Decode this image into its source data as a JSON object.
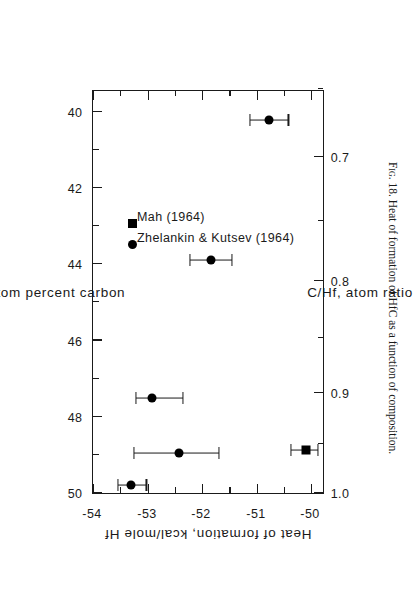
{
  "figure": {
    "caption_prefix": "Fig. 18.",
    "caption_text": "Heat of formation of HfC as a function of composition."
  },
  "chart_data": {
    "type": "scatter",
    "title": "",
    "orientation": "rotated-90-ccw",
    "xlabel": "Atom percent carbon",
    "xlabel_secondary": "C/Hf, atom ratio",
    "ylabel": "Heat of formation, kcal/mole Hf",
    "xlim": [
      39.4,
      50.0
    ],
    "ylim": [
      -54,
      -49.75
    ],
    "x_ticks": [
      50,
      48,
      46,
      44,
      42,
      40
    ],
    "x_tick_labels": [
      "50",
      "48",
      "46",
      "44",
      "42",
      "40"
    ],
    "x_minor_ticks": [
      49,
      47,
      45,
      43,
      41
    ],
    "x2_ticks": [
      1.0,
      0.9,
      0.8,
      0.7
    ],
    "x2_tick_labels": [
      "1.0",
      "0.9",
      "0.8",
      "0.7"
    ],
    "x2_minor_ticks": [
      0.95,
      0.85,
      0.75,
      0.65
    ],
    "y_ticks": [
      -54,
      -53,
      -52,
      -51,
      -50
    ],
    "y_tick_labels": [
      "-54",
      "-53",
      "-52",
      "-51",
      "-50"
    ],
    "y_minor_ticks": [
      -53.5,
      -52.5,
      -51.5,
      -50.5
    ],
    "grid": false,
    "legend_position": "inside-lower-left",
    "series": [
      {
        "name": "Zhelankin & Kutsev (1964)",
        "marker": "circle",
        "points": [
          {
            "x": 49.78,
            "y": -53.3,
            "xerr_low": 49.78,
            "xerr_high": 49.78,
            "yerr_low": -53.55,
            "yerr_high": -53.02
          },
          {
            "x": 48.95,
            "y": -52.43,
            "xerr_low": 48.95,
            "xerr_high": 48.95,
            "yerr_low": -53.25,
            "yerr_high": -51.7
          },
          {
            "x": 47.5,
            "y": -52.92,
            "xerr_low": 47.5,
            "xerr_high": 47.5,
            "yerr_low": -53.22,
            "yerr_high": -52.35
          },
          {
            "x": 43.88,
            "y": -51.83,
            "xerr_low": 43.88,
            "xerr_high": 43.88,
            "yerr_low": -52.22,
            "yerr_high": -51.45
          },
          {
            "x": 40.22,
            "y": -50.78,
            "xerr_low": 40.22,
            "xerr_high": 40.22,
            "yerr_low": -51.12,
            "yerr_high": -50.42
          }
        ]
      },
      {
        "name": "Mah (1964)",
        "marker": "square",
        "points": [
          {
            "x": 48.88,
            "y": -50.1,
            "xerr_low": 48.88,
            "xerr_high": 48.88,
            "yerr_low": -50.38,
            "yerr_high": -49.88
          }
        ]
      }
    ],
    "legend": [
      {
        "label": "Zhelankin & Kutsev (1964)",
        "marker": "circle"
      },
      {
        "label": "Mah (1964)",
        "marker": "square"
      }
    ]
  }
}
